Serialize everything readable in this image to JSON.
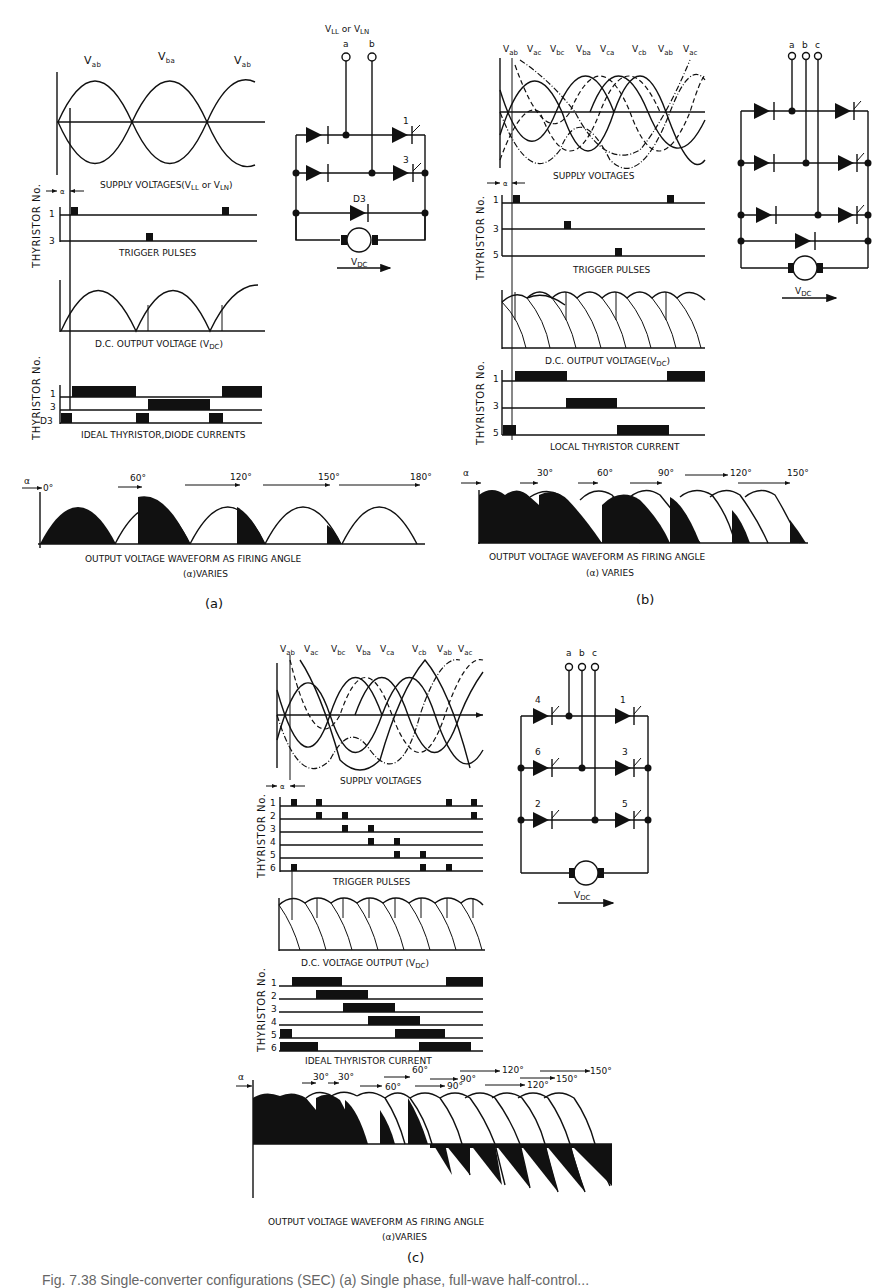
{
  "figure": {
    "caption": "Fig. 7.38 Single-converter configurations (SEC) (a) Single phase, full-wave half-control...",
    "panels": [
      {
        "id": "a",
        "label": "(a)",
        "supply_labels": [
          "Vab",
          "Vba",
          "Vab"
        ],
        "supply_caption": "SUPPLY VOLTAGES (VLL or VLN)",
        "supply_caption_main": "SUPPLY VOLTAGES(V",
        "supply_caption_ll": "LL",
        "supply_caption_or": " or V",
        "supply_caption_ln": "LN",
        "supply_caption_end": ")",
        "alpha_symbol": "α",
        "thyristor_axis": "THYRISTOR No.",
        "trigger_rows": [
          "1",
          "3"
        ],
        "trigger_caption": "TRIGGER PULSES",
        "dc_caption_main": "D.C. OUTPUT VOLTAGE (V",
        "dc_caption_sub": "DC",
        "dc_caption_end": ")",
        "current_rows": [
          "1",
          "3",
          "D3"
        ],
        "current_caption": "IDEAL THYRISTOR,DIODE CURRENTS",
        "firing_angles": [
          "0°",
          "60°",
          "120°",
          "150°",
          "180°"
        ],
        "waveform_caption_line1": "OUTPUT VOLTAGE WAVEFORM AS FIRING ANGLE",
        "waveform_caption_line2": "(α)VARIES",
        "circuit": {
          "source_label_main": "V",
          "source_label_ll": "LL",
          "source_or": " or V",
          "source_label_ln": "LN",
          "terminals": [
            "a",
            "b"
          ],
          "thyristor_labels": [
            "1",
            "3"
          ],
          "diode_label": "D3",
          "output_label": "V",
          "output_sub": "DC"
        }
      },
      {
        "id": "b",
        "label": "(b)",
        "supply_labels": [
          "Vab",
          "Vac",
          "Vbc",
          "Vba",
          "Vca",
          "Vcb",
          "Vab",
          "Vac"
        ],
        "supply_caption": "SUPPLY VOLTAGES",
        "alpha_symbol": "α",
        "thyristor_axis": "THYRISTOR No.",
        "trigger_rows": [
          "1",
          "3",
          "5"
        ],
        "trigger_caption": "TRIGGER PULSES",
        "dc_caption_main": "D.C. OUTPUT VOLTAGE(V",
        "dc_caption_sub": "DC",
        "dc_caption_end": ")",
        "current_rows": [
          "1",
          "3",
          "5"
        ],
        "current_caption": "LOCAL THYRISTOR CURRENT",
        "firing_angles": [
          "30°",
          "60°",
          "90°",
          "120°",
          "150°"
        ],
        "waveform_caption_line1": "OUTPUT VOLTAGE WAVEFORM AS FIRING ANGLE",
        "waveform_caption_line2": "(α) VARIES",
        "circuit": {
          "terminals": [
            "a",
            "b",
            "c"
          ],
          "output_label": "V",
          "output_sub": "DC"
        }
      },
      {
        "id": "c",
        "label": "(c)",
        "supply_labels": [
          "Vab",
          "Vac",
          "Vbc",
          "Vba",
          "Vca",
          "Vcb",
          "Vab",
          "Vac"
        ],
        "supply_caption": "SUPPLY VOLTAGES",
        "alpha_symbol": "α",
        "thyristor_axis": "THYRISTOR No.",
        "trigger_rows": [
          "1",
          "2",
          "3",
          "4",
          "5",
          "6"
        ],
        "trigger_caption": "TRIGGER PULSES",
        "dc_caption_main": "D.C. VOLTAGE OUTPUT (V",
        "dc_caption_sub": "DC",
        "dc_caption_end": ")",
        "current_rows": [
          "1",
          "2",
          "3",
          "4",
          "5",
          "6"
        ],
        "current_caption": "IDEAL THYRISTOR CURRENT",
        "firing_angles_row1": [
          "30°",
          "30°",
          "60°",
          "90°",
          "120°",
          "150°"
        ],
        "firing_angles_row2": [
          "60°",
          "90°",
          "120°",
          "150°"
        ],
        "waveform_caption_line1": "OUTPUT VOLTAGE WAVEFORM  AS FIRING ANGLE",
        "waveform_caption_line2": "(α)VARIES",
        "circuit": {
          "terminals": [
            "a",
            "b",
            "c"
          ],
          "thyristor_labels": [
            "4",
            "1",
            "6",
            "3",
            "2",
            "5"
          ],
          "output_label": "V",
          "output_sub": "DC"
        }
      }
    ]
  }
}
